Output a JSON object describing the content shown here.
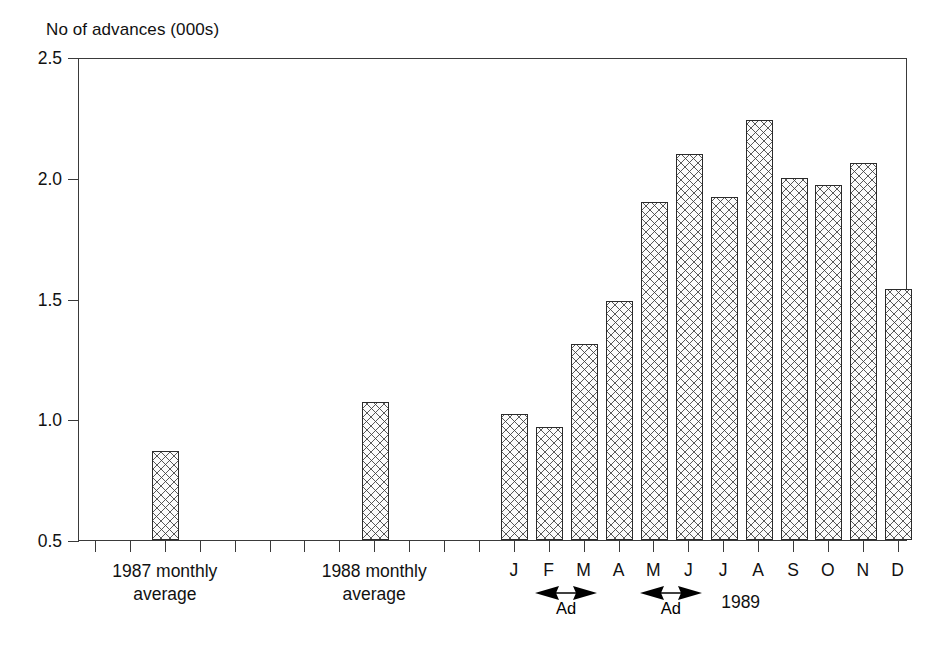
{
  "chart_data": {
    "type": "bar",
    "title": "No of advances (000s)",
    "xlabel": "",
    "ylabel": "No of advances (000s)",
    "ylim": [
      0.5,
      2.5
    ],
    "yticks": [
      "0.5",
      "1.0",
      "1.5",
      "2.0",
      "2.5"
    ],
    "ytick_values": [
      0.5,
      1.0,
      1.5,
      2.0,
      2.5
    ],
    "grid": false,
    "legend": "none",
    "categories": [
      "1987 monthly average",
      "1988 monthly average",
      "J",
      "F",
      "M",
      "A",
      "M",
      "J",
      "J",
      "A",
      "S",
      "O",
      "N",
      "D"
    ],
    "values": [
      0.87,
      1.07,
      1.02,
      0.97,
      1.31,
      1.49,
      1.9,
      2.1,
      1.92,
      2.24,
      2.0,
      1.97,
      2.06,
      1.54
    ],
    "series": [
      {
        "name": "No of advances (000s)",
        "values": [
          0.87,
          1.07,
          1.02,
          0.97,
          1.31,
          1.49,
          1.9,
          2.1,
          1.92,
          2.24,
          2.0,
          1.97,
          2.06,
          1.54
        ]
      }
    ],
    "annotations": [
      {
        "label": "Ad",
        "span": [
          "F",
          "M"
        ]
      },
      {
        "label": "Ad",
        "span": [
          "M",
          "J"
        ]
      },
      {
        "label": "1989",
        "span": [
          "J",
          "D"
        ]
      }
    ],
    "group_labels": [
      {
        "line1": "1987 monthly",
        "line2": "average"
      },
      {
        "line1": "1988 monthly",
        "line2": "average"
      }
    ],
    "year_label": "1989",
    "colors": {
      "axis": "#3a3a3a",
      "bar_edge": "#2b2b2b",
      "bar_fill": "#fbfbfb",
      "hatch": "#3c3c3c",
      "text": "#111111",
      "background": "#ffffff"
    }
  },
  "axis": {
    "title": "No of advances (000s)",
    "yticks": [
      "0.5",
      "1.0",
      "1.5",
      "2.0",
      "2.5"
    ]
  },
  "months": [
    "J",
    "F",
    "M",
    "A",
    "M",
    "J",
    "J",
    "A",
    "S",
    "O",
    "N",
    "D"
  ],
  "groups": [
    {
      "line1": "1987 monthly",
      "line2": "average"
    },
    {
      "line1": "1988 monthly",
      "line2": "average"
    }
  ],
  "annotations": {
    "ad_label_1": "Ad",
    "ad_label_2": "Ad",
    "year": "1989"
  }
}
